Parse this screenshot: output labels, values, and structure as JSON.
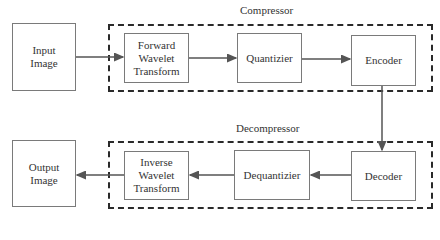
{
  "diagram": {
    "groups": {
      "compressor": {
        "label": "Compressor"
      },
      "decompressor": {
        "label": "Decompressor"
      }
    },
    "nodes": {
      "input_image": {
        "label": "Input Image"
      },
      "forward_wavelet": {
        "label": "Forward Wavelet Transform"
      },
      "quantizier": {
        "label": "Quantizier"
      },
      "encoder": {
        "label": "Encoder"
      },
      "decoder": {
        "label": "Decoder"
      },
      "dequantizier": {
        "label": "Dequantizier"
      },
      "inverse_wavelet": {
        "label": "Inverse Wavelet Transform"
      },
      "output_image": {
        "label": "Output Image"
      }
    },
    "edges": [
      {
        "from": "Input Image",
        "to": "Forward Wavelet Transform"
      },
      {
        "from": "Forward Wavelet Transform",
        "to": "Quantizier"
      },
      {
        "from": "Quantizier",
        "to": "Encoder"
      },
      {
        "from": "Encoder",
        "to": "Decoder"
      },
      {
        "from": "Decoder",
        "to": "Dequantizier"
      },
      {
        "from": "Dequantizier",
        "to": "Inverse Wavelet Transform"
      },
      {
        "from": "Inverse Wavelet Transform",
        "to": "Output Image"
      }
    ]
  }
}
